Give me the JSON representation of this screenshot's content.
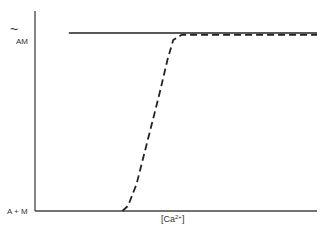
{
  "chart_data": {
    "type": "line",
    "title": "",
    "xlabel": "[Ca2+]",
    "xlabel_parts": {
      "open": "[",
      "base": "Ca",
      "sup": "2+",
      "close": "]"
    },
    "ylabel": "",
    "y_tick_labels": {
      "top": "AM",
      "top_symbol": "~",
      "bottom": "A + M"
    },
    "grid": false,
    "legend": null,
    "series": [
      {
        "name": "solid",
        "style": "solid",
        "description": "Constant at upper level (~AM) across all [Ca2+]",
        "x": [
          0.12,
          1.0
        ],
        "y": [
          1.0,
          1.0
        ]
      },
      {
        "name": "dashed",
        "style": "dashed",
        "description": "Steep sigmoidal rise from A+M to ~AM with increasing [Ca2+]",
        "x": [
          0.31,
          0.33,
          0.36,
          0.4,
          0.44,
          0.47,
          0.49,
          0.52,
          1.0
        ],
        "y": [
          0.0,
          0.03,
          0.15,
          0.4,
          0.65,
          0.85,
          0.96,
          0.99,
          0.99
        ]
      }
    ],
    "xlim": [
      0,
      1
    ],
    "ylim": [
      0,
      1
    ]
  }
}
